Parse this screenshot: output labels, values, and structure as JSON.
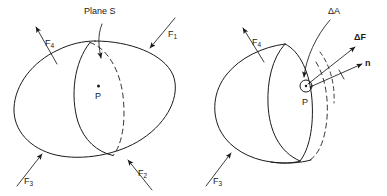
{
  "figure": {
    "background_color": "#ffffff",
    "line_color": "#1a1a1a"
  },
  "panels": [
    {
      "id": "left",
      "name": "whole-body-cut-by-plane",
      "description": "Closed body loaded by four external forces, intersected by cutting plane S through interior point P",
      "labels": {
        "plane": "Plane S",
        "point": "P",
        "force1": "F",
        "force1_sub": "1",
        "force2": "F",
        "force2_sub": "2",
        "force3": "F",
        "force3_sub": "3",
        "force4": "F",
        "force4_sub": "4"
      }
    },
    {
      "id": "right",
      "name": "sectioned-half-body",
      "description": "Left half of the body after sectioning on plane S, showing the exposed cut face with an elemental area at point P",
      "labels": {
        "point": "P",
        "area_element": "ΔA",
        "force_element": "ΔF",
        "normal": "n",
        "force3": "F",
        "force3_sub": "3",
        "force4": "F",
        "force4_sub": "4"
      }
    }
  ],
  "symbols": {
    "delta": "Δ",
    "arrowhead": "filled-triangle"
  }
}
